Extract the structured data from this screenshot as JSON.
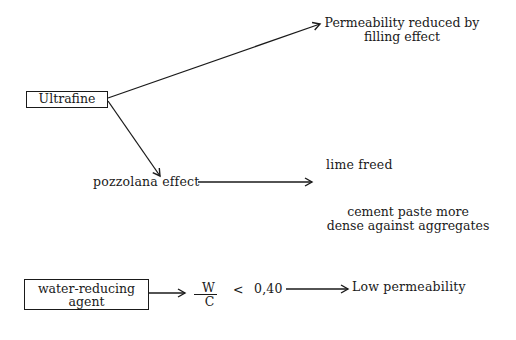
{
  "diagram": {
    "nodes": {
      "ultrafine": {
        "label": "Ultrafine"
      },
      "permeability_filling": {
        "line1": "Permeability reduced by",
        "line2": "filling effect"
      },
      "pozzolana": {
        "label": "pozzolana effect"
      },
      "lime_freed": {
        "label": "lime freed"
      },
      "cement_paste": {
        "line1": "cement paste more",
        "line2": "dense against aggregates"
      },
      "water_reducing": {
        "line1": "water-reducing",
        "line2": "agent"
      },
      "ratio": {
        "numerator": "W",
        "denominator": "C",
        "operator": "<",
        "value": "0,40"
      },
      "low_permeability": {
        "label": "Low permeability"
      }
    },
    "edges": [
      {
        "from": "Ultrafine",
        "to": "Permeability reduced by filling effect"
      },
      {
        "from": "Ultrafine",
        "to": "pozzolana effect"
      },
      {
        "from": "pozzolana effect",
        "to": "lime freed / cement paste more dense against aggregates"
      },
      {
        "from": "water-reducing agent",
        "to": "W/C < 0,40"
      },
      {
        "from": "0,40",
        "to": "Low permeability"
      }
    ]
  }
}
